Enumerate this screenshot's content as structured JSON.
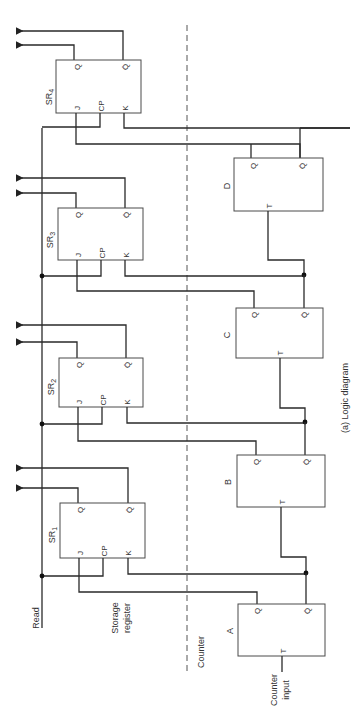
{
  "caption": "(a) Logic diagram",
  "signals": {
    "read": "Read",
    "counter_input_1": "Counter",
    "counter_input_2": "input"
  },
  "sections": {
    "storage_1": "Storage",
    "storage_2": "register",
    "counter": "Counter"
  },
  "storage_register": [
    {
      "name": "SR",
      "sub": "4",
      "pins": {
        "q": "Q",
        "qbar": "Q̄",
        "j": "J",
        "cp": "CP",
        "k": "K"
      }
    },
    {
      "name": "SR",
      "sub": "3",
      "pins": {
        "q": "Q",
        "qbar": "Q̄",
        "j": "J",
        "cp": "CP",
        "k": "K"
      }
    },
    {
      "name": "SR",
      "sub": "2",
      "pins": {
        "q": "Q",
        "qbar": "Q̄",
        "j": "J",
        "cp": "CP",
        "k": "K"
      }
    },
    {
      "name": "SR",
      "sub": "1",
      "pins": {
        "q": "Q",
        "qbar": "Q̄",
        "j": "J",
        "cp": "CP",
        "k": "K"
      }
    }
  ],
  "counter_flipflops": [
    {
      "name": "D",
      "pins": {
        "q": "Q",
        "qbar": "Q̄",
        "t": "T"
      }
    },
    {
      "name": "C",
      "pins": {
        "q": "Q",
        "qbar": "Q̄",
        "t": "T"
      }
    },
    {
      "name": "B",
      "pins": {
        "q": "Q",
        "qbar": "Q̄",
        "t": "T"
      }
    },
    {
      "name": "A",
      "pins": {
        "q": "Q",
        "qbar": "Q̄",
        "t": "T"
      }
    }
  ]
}
